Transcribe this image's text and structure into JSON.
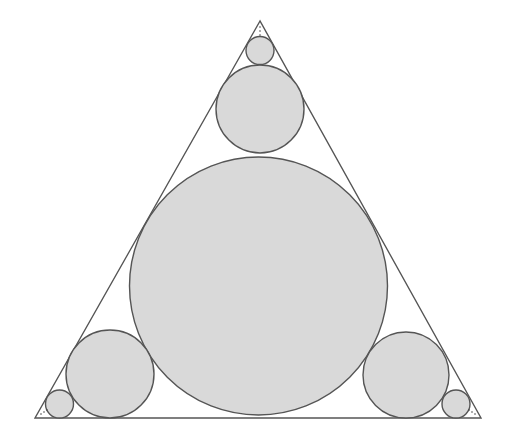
{
  "diagram": {
    "title": "",
    "colors": {
      "background": "#ffffff",
      "stroke": "#555555",
      "circle_fill": "#d9d9d9",
      "dots": "#444444"
    },
    "triangle": {
      "vertices": [
        [
          260,
          21
        ],
        [
          35,
          418
        ],
        [
          481,
          418
        ]
      ]
    },
    "circles": [
      {
        "id": "incircle",
        "cx": 258.5,
        "cy": 286,
        "r": 129
      },
      {
        "id": "top-medium",
        "cx": 260,
        "cy": 109,
        "r": 44
      },
      {
        "id": "top-small",
        "cx": 260,
        "cy": 50.5,
        "r": 14
      },
      {
        "id": "left-medium",
        "cx": 110,
        "cy": 374,
        "r": 44
      },
      {
        "id": "left-small",
        "cx": 59.5,
        "cy": 404,
        "r": 14
      },
      {
        "id": "right-medium",
        "cx": 406,
        "cy": 375,
        "r": 43
      },
      {
        "id": "right-small",
        "cx": 456,
        "cy": 404,
        "r": 14
      }
    ],
    "continuation_dots": [
      {
        "id": "top",
        "points": [
          [
            260,
            27
          ],
          [
            260,
            31
          ],
          [
            260,
            35
          ]
        ]
      },
      {
        "id": "left",
        "points": [
          [
            41,
            414
          ],
          [
            44,
            412
          ],
          [
            47,
            410
          ]
        ]
      },
      {
        "id": "right",
        "points": [
          [
            475,
            414
          ],
          [
            472,
            412
          ],
          [
            469,
            410
          ]
        ]
      }
    ]
  }
}
